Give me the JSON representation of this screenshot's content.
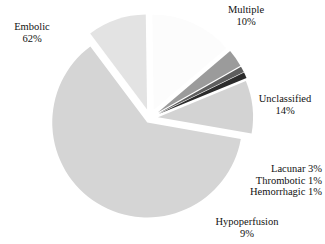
{
  "chart_data": {
    "type": "pie",
    "title": "",
    "subtitle": "",
    "xlabel": "",
    "ylabel": "",
    "legend_position": "none",
    "grid": false,
    "exploded": true,
    "units": "percent",
    "categories": [
      "Embolic",
      "Multiple",
      "Unclassified",
      "Lacunar",
      "Thrombotic",
      "Hemorrhagic",
      "Hypoperfusion"
    ],
    "values": [
      62,
      10,
      14,
      3,
      1,
      1,
      9
    ],
    "slices": [
      {
        "name": "Embolic",
        "label_name": "Embolic",
        "label_value": "62%",
        "value": 62,
        "color": "#d5d5d5",
        "start_angle": 100,
        "end_angle": 323.2,
        "explode": 0.055,
        "label_align": "center"
      },
      {
        "name": "Multiple",
        "label_name": "Multiple",
        "label_value": "10%",
        "value": 10,
        "color": "#e3e3e3",
        "start_angle": 323.2,
        "end_angle": 359.2,
        "explode": 0.095,
        "label_align": "center"
      },
      {
        "name": "Unclassified",
        "label_name": "Unclassified",
        "label_value": "14%",
        "value": 14,
        "color": "#fcfcfc",
        "start_angle": 359.2,
        "end_angle": 409.6,
        "explode": 0.095,
        "label_align": "center"
      },
      {
        "name": "Lacunar",
        "label_name": "Lacunar 3%",
        "label_value": "",
        "value": 3,
        "color": "#9b9b9b",
        "start_angle": 409.6,
        "end_angle": 420.4,
        "explode": 0.1,
        "label_align": "right"
      },
      {
        "name": "Thrombotic",
        "label_name": "Thrombotic 1%",
        "label_value": "",
        "value": 1,
        "color": "#5e5e5e",
        "start_angle": 420.4,
        "end_angle": 424.0,
        "explode": 0.1,
        "label_align": "right"
      },
      {
        "name": "Hemorrhagic",
        "label_name": "Hemorrhagic 1%",
        "label_value": "",
        "value": 1,
        "color": "#2b2b2b",
        "start_angle": 424.0,
        "end_angle": 427.6,
        "explode": 0.1,
        "label_align": "right"
      },
      {
        "name": "Hypoperfusion",
        "label_name": "Hypoperfusion",
        "label_value": "9%",
        "value": 9,
        "color": "#d3d3d3",
        "start_angle": 427.6,
        "end_angle": 460.0,
        "explode": 0.085,
        "label_align": "center"
      }
    ],
    "geometry": {
      "cx": 150,
      "cy": 118,
      "radius": 95
    }
  },
  "labels": {
    "embolic": {
      "name": "Embolic",
      "value": "62%"
    },
    "multiple": {
      "name": "Multiple",
      "value": "10%"
    },
    "unclassified": {
      "name": "Unclassified",
      "value": "14%"
    },
    "lacunar": {
      "name": "Lacunar 3%"
    },
    "thrombotic": {
      "name": "Thrombotic 1%"
    },
    "hemorrhagic": {
      "name": "Hemorrhagic 1%"
    },
    "hypoperfusion": {
      "name": "Hypoperfusion",
      "value": "9%"
    }
  }
}
